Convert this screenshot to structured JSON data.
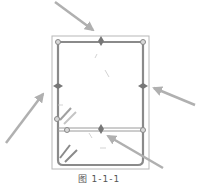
{
  "figure": {
    "caption": "图 1-1-1",
    "colors": {
      "outline": "#b8b8b8",
      "rebar": "#8a8a8a",
      "arrow": "#b0b0b0",
      "background": "#ffffff"
    },
    "section": {
      "outer_rect": {
        "x": 52,
        "y": 36,
        "w": 97,
        "h": 133
      },
      "stirrup_rect": {
        "x": 57,
        "y": 41,
        "w": 87,
        "h": 124,
        "corner_radius": 5
      },
      "tie_bar_y": 130
    },
    "rebars": [
      {
        "name": "top-left",
        "x": 58,
        "y": 42
      },
      {
        "name": "top-mid",
        "x": 101,
        "y": 42
      },
      {
        "name": "top-right",
        "x": 143,
        "y": 42
      },
      {
        "name": "left-mid",
        "x": 58,
        "y": 86
      },
      {
        "name": "right-mid",
        "x": 143,
        "y": 86
      },
      {
        "name": "tie-left",
        "x": 67,
        "y": 130
      },
      {
        "name": "tie-mid",
        "x": 101,
        "y": 130
      },
      {
        "name": "tie-right",
        "x": 143,
        "y": 130
      },
      {
        "name": "hook-left",
        "x": 57,
        "y": 119
      }
    ],
    "arrows": [
      {
        "name": "arrow-top",
        "x1": 55,
        "y1": 2,
        "x2": 93,
        "y2": 30
      },
      {
        "name": "arrow-left",
        "x1": 6,
        "y1": 143,
        "x2": 43,
        "y2": 94
      },
      {
        "name": "arrow-right",
        "x1": 195,
        "y1": 105,
        "x2": 154,
        "y2": 88
      },
      {
        "name": "arrow-bottom-right",
        "x1": 163,
        "y1": 168,
        "x2": 108,
        "y2": 136
      }
    ]
  }
}
